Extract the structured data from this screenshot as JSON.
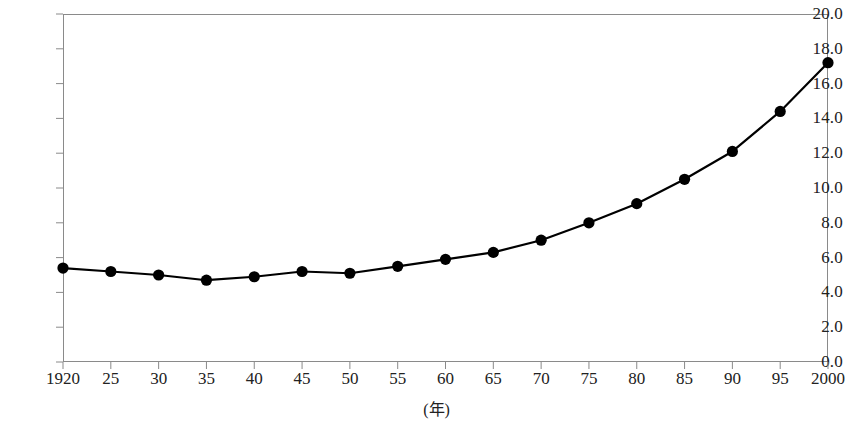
{
  "chart_data": {
    "type": "line",
    "title": "",
    "subtitle": "",
    "xlabel": "(年)",
    "ylabel": "",
    "x": [
      1920,
      1925,
      1930,
      1935,
      1940,
      1945,
      1950,
      1955,
      1960,
      1965,
      1970,
      1975,
      1980,
      1985,
      1990,
      1995,
      2000
    ],
    "xtick_labels": [
      "1920",
      "25",
      "30",
      "35",
      "40",
      "45",
      "50",
      "55",
      "60",
      "65",
      "70",
      "75",
      "80",
      "85",
      "90",
      "95",
      "2000"
    ],
    "values": [
      5.4,
      5.2,
      5.0,
      4.7,
      4.9,
      5.2,
      5.1,
      5.5,
      5.9,
      6.3,
      7.0,
      8.0,
      9.1,
      10.5,
      12.1,
      14.4,
      17.2
    ],
    "ytick_labels": [
      "0.0",
      "2.0",
      "4.0",
      "6.0",
      "8.0",
      "10.0",
      "12.0",
      "14.0",
      "16.0",
      "18.0",
      "20.0"
    ],
    "ytick_values": [
      0,
      2,
      4,
      6,
      8,
      10,
      12,
      14,
      16,
      18,
      20
    ],
    "ylim": [
      0,
      20
    ],
    "grid": false,
    "legend": null,
    "series": [
      {
        "name": "",
        "marker": "filled-circle",
        "color": "#000000",
        "line_color": "#000000",
        "values": [
          5.4,
          5.2,
          5.0,
          4.7,
          4.9,
          5.2,
          5.1,
          5.5,
          5.9,
          6.3,
          7.0,
          8.0,
          9.1,
          10.5,
          12.1,
          14.4,
          17.2
        ]
      }
    ],
    "colors": {
      "line": "#000000",
      "marker": "#000000",
      "axis": "#8a8a8a",
      "text": "#222222",
      "background": "#ffffff"
    }
  }
}
